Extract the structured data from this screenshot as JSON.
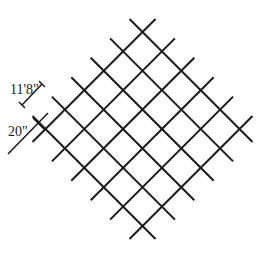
{
  "diagram": {
    "type": "diagonal-grid-lattice",
    "lines_per_direction": 6,
    "line_color": "#1a1a1a",
    "background": "#ffffff",
    "grid": {
      "top_intersection": [
        142.5,
        32
      ],
      "step": 19.4,
      "overhang": 13
    }
  },
  "dimensions": {
    "spacing_label": "11'8\"",
    "width_label": "20\""
  }
}
